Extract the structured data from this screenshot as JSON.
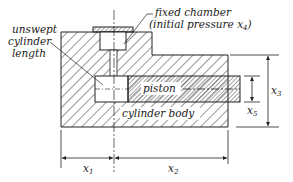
{
  "diagram": {
    "labels": {
      "fixed_chamber_line1": "fixed chamber",
      "fixed_chamber_line2": "(initial pressure x",
      "fixed_chamber_sub": "4",
      "fixed_chamber_close": ")",
      "unswept_line1": "unswept",
      "unswept_line2": "cylinder",
      "unswept_line3": "length",
      "piston": "piston",
      "cylinder_body": "cylinder body"
    },
    "dimensions": {
      "x1": {
        "base": "x",
        "sub": "1"
      },
      "x2": {
        "base": "x",
        "sub": "2"
      },
      "x3": {
        "base": "x",
        "sub": "3"
      },
      "x5": {
        "base": "x",
        "sub": "5"
      }
    },
    "colors": {
      "ink": "#222222",
      "background": "#ffffff"
    }
  }
}
